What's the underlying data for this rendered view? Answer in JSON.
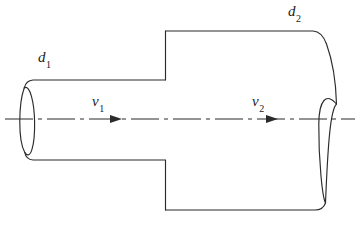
{
  "figure": {
    "type": "engineering-diagram",
    "background_color": "#ffffff",
    "line_color": "#2b2b2b",
    "text_color": "#1a1a1a"
  },
  "labels": {
    "d1": {
      "symbol": "d",
      "subscript": "1"
    },
    "d2": {
      "symbol": "d",
      "subscript": "2"
    },
    "v1": {
      "symbol": "v",
      "subscript": "1"
    },
    "v2": {
      "symbol": "v",
      "subscript": "2"
    }
  },
  "geometry": {
    "small_pipe": {
      "x_start": 27,
      "x_end": 165,
      "top_y": 80,
      "bottom_y": 160,
      "end_cap_ellipse": {
        "cx": 27,
        "cy": 119,
        "rx": 9,
        "ry": 41
      }
    },
    "large_pipe": {
      "x_start": 165,
      "x_end": 324,
      "top_y": 31,
      "bottom_y": 210,
      "end_cap_ellipse": {
        "cx": 324,
        "cy": 119,
        "rx": 13,
        "ry": 91
      }
    },
    "centerline": {
      "y": 119,
      "x_start": 5,
      "x_end": 355,
      "style": "dash-dot"
    },
    "flow_arrows": [
      {
        "name": "v1-arrow",
        "tip_x": 122,
        "y": 119,
        "direction": "right"
      },
      {
        "name": "v2-arrow",
        "tip_x": 278,
        "y": 119,
        "direction": "right"
      }
    ]
  }
}
